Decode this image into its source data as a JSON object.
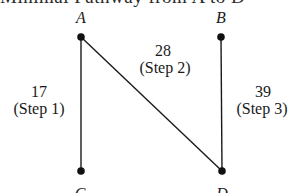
{
  "title": "Minimal Pathway from A to D",
  "nodes": [
    {
      "id": "A",
      "label": "A"
    },
    {
      "id": "B",
      "label": "B"
    },
    {
      "id": "C",
      "label": "C"
    },
    {
      "id": "D",
      "label": "D"
    }
  ],
  "edges": [
    {
      "from": "A",
      "to": "C",
      "weight": "17",
      "step": "(Step 1)"
    },
    {
      "from": "A",
      "to": "D",
      "weight": "28",
      "step": "(Step 2)"
    },
    {
      "from": "B",
      "to": "D",
      "weight": "39",
      "step": "(Step 3)"
    }
  ]
}
